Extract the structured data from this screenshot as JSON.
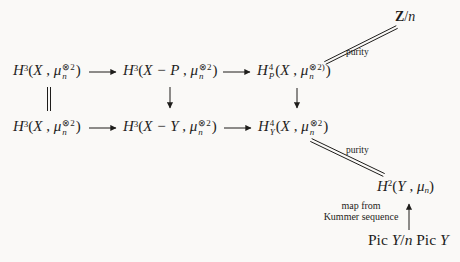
{
  "canvas": {
    "bg": "#faf9f7",
    "ink": "#1e1d1b"
  },
  "nodes": {
    "h3x_row1": {
      "plain": "H3(X, mu_n^(x)2)",
      "parts": [
        {
          "t": "H",
          "s": "it"
        },
        {
          "sup": "3"
        },
        {
          "t": "(",
          "s": "rm"
        },
        {
          "t": "X",
          "s": "it"
        },
        {
          "t": " , ",
          "s": "rm"
        },
        {
          "t": "μ",
          "s": "it"
        },
        {
          "sup": "⊗2",
          "sub": "n"
        },
        {
          "t": ")",
          "s": "rm"
        }
      ]
    },
    "h3xp_row1": {
      "plain": "H3(X - P, mu_n^(x)2)",
      "parts": [
        {
          "t": "H",
          "s": "it"
        },
        {
          "sup": "3"
        },
        {
          "t": "(",
          "s": "rm"
        },
        {
          "t": "X − P",
          "s": "it"
        },
        {
          "t": " , ",
          "s": "rm"
        },
        {
          "t": "μ",
          "s": "it"
        },
        {
          "sup": "⊗2",
          "sub": "n"
        },
        {
          "t": ")",
          "s": "rm"
        }
      ]
    },
    "h4p_row1": {
      "plain": "H4_P(X, mu_n^(x)2))",
      "parts": [
        {
          "t": "H",
          "s": "it"
        },
        {
          "sup": "4",
          "sub": "P"
        },
        {
          "t": "(",
          "s": "rm"
        },
        {
          "t": "X",
          "s": "it"
        },
        {
          "t": " , ",
          "s": "rm"
        },
        {
          "t": "μ",
          "s": "it"
        },
        {
          "sup": "⊗2)",
          "sub": "n"
        },
        {
          "t": ")",
          "s": "rm"
        }
      ]
    },
    "h3x_row2": {
      "plain": "H3(X, mu_n^(x)2)",
      "parts": [
        {
          "t": "H",
          "s": "it"
        },
        {
          "sup": "3"
        },
        {
          "t": "(",
          "s": "rm"
        },
        {
          "t": "X",
          "s": "it"
        },
        {
          "t": " , ",
          "s": "rm"
        },
        {
          "t": "μ",
          "s": "it"
        },
        {
          "sup": "⊗2",
          "sub": "n"
        },
        {
          "t": ")",
          "s": "rm"
        }
      ]
    },
    "h3xy_row2": {
      "plain": "H3(X - Y, mu_n^(x)2)",
      "parts": [
        {
          "t": "H",
          "s": "it"
        },
        {
          "sup": "3"
        },
        {
          "t": "(",
          "s": "rm"
        },
        {
          "t": "X − Y",
          "s": "it"
        },
        {
          "t": " , ",
          "s": "rm"
        },
        {
          "t": "μ",
          "s": "it"
        },
        {
          "sup": "⊗2",
          "sub": "n"
        },
        {
          "t": ")",
          "s": "rm"
        }
      ]
    },
    "h4y_row2": {
      "plain": "H4_Y(X, mu_n^(x)2)",
      "parts": [
        {
          "t": "H",
          "s": "it"
        },
        {
          "sup": "4",
          "sub": "Y"
        },
        {
          "t": "(",
          "s": "rm"
        },
        {
          "t": "X",
          "s": "it"
        },
        {
          "t": " , ",
          "s": "rm"
        },
        {
          "t": "μ",
          "s": "it"
        },
        {
          "sup": "⊗2",
          "sub": "n"
        },
        {
          "t": ")",
          "s": "rm"
        }
      ]
    },
    "zn": {
      "plain": "Z/n",
      "parts": [
        {
          "t": "Z",
          "s": "bf"
        },
        {
          "t": "/",
          "s": "rm"
        },
        {
          "t": "n",
          "s": "it"
        }
      ]
    },
    "h2y": {
      "plain": "H2(Y, mu_n)",
      "parts": [
        {
          "t": "H",
          "s": "it"
        },
        {
          "sup": "2"
        },
        {
          "t": "(",
          "s": "rm"
        },
        {
          "t": "Y",
          "s": "it"
        },
        {
          "t": " , ",
          "s": "rm"
        },
        {
          "t": "μ",
          "s": "it"
        },
        {
          "sub": "n"
        },
        {
          "t": ")",
          "s": "rm"
        }
      ]
    },
    "pic": {
      "plain": "Pic Y/n Pic Y",
      "parts": [
        {
          "t": "Pic ",
          "s": "rm"
        },
        {
          "t": "Y",
          "s": "it"
        },
        {
          "t": "/",
          "s": "rm"
        },
        {
          "t": "n",
          "s": "it"
        },
        {
          "t": " Pic ",
          "s": "rm"
        },
        {
          "t": "Y",
          "s": "it"
        }
      ]
    }
  },
  "labels": {
    "purity_top": "purity",
    "purity_bottom": "purity",
    "map_from": "map from",
    "kummer": "Kummer sequence"
  },
  "edges": [
    {
      "from": "H3(X,mu^2) row1",
      "to": "H3(X-P,mu^2)",
      "type": "arrow-right"
    },
    {
      "from": "H3(X-P,mu^2)",
      "to": "H4_P(X,mu^2)",
      "type": "arrow-right"
    },
    {
      "from": "H3(X,mu^2) row2",
      "to": "H3(X-Y,mu^2)",
      "type": "arrow-right"
    },
    {
      "from": "H3(X-Y,mu^2)",
      "to": "H4_Y(X,mu^2)",
      "type": "arrow-right"
    },
    {
      "from": "H3(X,mu^2) row1",
      "to": "H3(X,mu^2) row2",
      "type": "equals"
    },
    {
      "from": "H3(X-P,mu^2)",
      "to": "H3(X-Y,mu^2)",
      "type": "arrow-down"
    },
    {
      "from": "H4_P(X,mu^2)",
      "to": "H4_Y(X,mu^2)",
      "type": "arrow-down"
    },
    {
      "from": "H4_P(X,mu^2)",
      "to": "Z/n",
      "type": "double-line-isomorphism",
      "label": "purity"
    },
    {
      "from": "H4_Y(X,mu^2)",
      "to": "H2(Y,mu_n)",
      "type": "double-line-isomorphism",
      "label": "purity"
    },
    {
      "from": "Pic Y/n Pic Y",
      "to": "H2(Y,mu_n)",
      "type": "arrow-up",
      "label": "map from Kummer sequence"
    }
  ]
}
